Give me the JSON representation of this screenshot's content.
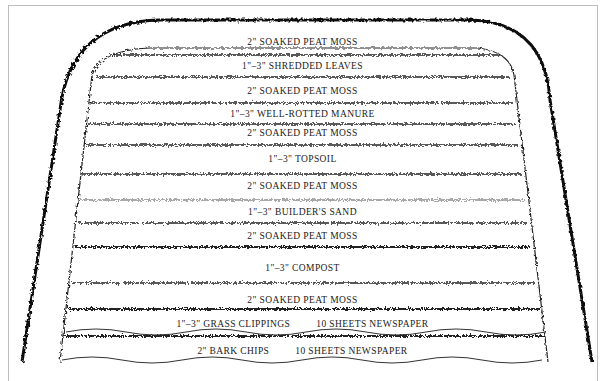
{
  "diagram": {
    "type": "layered-garden-bed-cross-section",
    "layers": [
      {
        "label": "2\" SOAKED PEAT MOSS",
        "y": 42
      },
      {
        "label": "1\"–3\" SHREDDED LEAVES",
        "y": 66
      },
      {
        "label": "2\" SOAKED PEAT MOSS",
        "y": 91
      },
      {
        "label": "1\"–3\" WELL-ROTTED MANURE",
        "y": 114
      },
      {
        "label": "2\" SOAKED PEAT MOSS",
        "y": 133
      },
      {
        "label": "1\"–3\" TOPSOIL",
        "y": 159
      },
      {
        "label": "2\" SOAKED PEAT MOSS",
        "y": 186
      },
      {
        "label": "1\"–3\" BUILDER'S SAND",
        "y": 212
      },
      {
        "label": "2\" SOAKED PEAT MOSS",
        "y": 236
      },
      {
        "label": "1\"–3\" COMPOST",
        "y": 268
      },
      {
        "label": "2\" SOAKED PEAT MOSS",
        "y": 300
      }
    ],
    "base_layers": [
      {
        "left": "1\"–3\" GRASS CLIPPINGS",
        "right": "10 SHEETS NEWSPAPER",
        "y": 324
      },
      {
        "left": "2\" BARK CHIPS",
        "right": "10 SHEETS NEWSPAPER",
        "y": 351
      }
    ]
  }
}
